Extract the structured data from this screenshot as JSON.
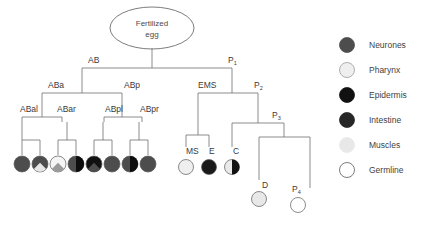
{
  "diagram": {
    "title_node": {
      "line1": "Fertilized",
      "line2": "egg"
    },
    "colors": {
      "neurones": "#4d4d4d",
      "pharynx": "#efefef",
      "epidermis": "#111111",
      "intestine": "#262626",
      "muscles": "#e6e6e6",
      "germline": "#ffffff",
      "line": "#6e6e6e",
      "text": "#3a3a3a",
      "cell_outline": "#5a5a5a"
    },
    "tree_labels": [
      {
        "id": "AB",
        "text": "AB",
        "sub": "",
        "x": 88,
        "y": 63
      },
      {
        "id": "P1",
        "text": "P",
        "sub": "1",
        "x": 228,
        "y": 63
      },
      {
        "id": "ABa",
        "text": "ABa",
        "sub": "",
        "x": 48,
        "y": 88
      },
      {
        "id": "ABp",
        "text": "ABp",
        "sub": "",
        "x": 124,
        "y": 88
      },
      {
        "id": "EMS",
        "text": "EMS",
        "sub": "",
        "x": 198,
        "y": 88
      },
      {
        "id": "P2",
        "text": "P",
        "sub": "2",
        "x": 254,
        "y": 88
      },
      {
        "id": "ABal",
        "text": "ABal",
        "sub": "",
        "x": 20,
        "y": 112
      },
      {
        "id": "ABar",
        "text": "ABar",
        "sub": "",
        "x": 57,
        "y": 112
      },
      {
        "id": "ABpl",
        "text": "ABpl",
        "sub": "",
        "x": 105,
        "y": 112
      },
      {
        "id": "ABpr",
        "text": "ABpr",
        "sub": "",
        "x": 140,
        "y": 112
      },
      {
        "id": "P3",
        "text": "P",
        "sub": "3",
        "x": 272,
        "y": 118
      },
      {
        "id": "MS",
        "text": "MS",
        "sub": "",
        "x": 186,
        "y": 154
      },
      {
        "id": "E",
        "text": "E",
        "sub": "",
        "x": 209,
        "y": 154
      },
      {
        "id": "C",
        "text": "C",
        "sub": "",
        "x": 233,
        "y": 154
      },
      {
        "id": "D",
        "text": "D",
        "sub": "",
        "x": 262,
        "y": 188
      },
      {
        "id": "P4",
        "text": "P",
        "sub": "4",
        "x": 292,
        "y": 192
      }
    ],
    "terminal_cells": [
      {
        "id": "cell-abal-1",
        "x": 22,
        "y": 164,
        "r": 8,
        "fill": "#4d4d4d",
        "wedge": null
      },
      {
        "id": "cell-abal-2",
        "x": 40,
        "y": 164,
        "r": 8,
        "fill": "#4d4d4d",
        "wedge": "#e6e6e6"
      },
      {
        "id": "cell-abar-1",
        "x": 58,
        "y": 164,
        "r": 8,
        "fill": "#f4f4f4",
        "wedge": "#9a9a9a"
      },
      {
        "id": "cell-abar-2",
        "x": 76,
        "y": 164,
        "r": 8,
        "fill": "#4d4d4d",
        "half": "#0d0d0d"
      },
      {
        "id": "cell-abpl-1",
        "x": 94,
        "y": 164,
        "r": 8,
        "fill": "#111111",
        "wedge": "#4d4d4d"
      },
      {
        "id": "cell-abpl-2",
        "x": 112,
        "y": 164,
        "r": 8,
        "fill": "#4d4d4d",
        "wedge": null
      },
      {
        "id": "cell-abpr-1",
        "x": 130,
        "y": 164,
        "r": 8,
        "fill": "#4d4d4d",
        "half": "#0d0d0d"
      },
      {
        "id": "cell-abpr-2",
        "x": 148,
        "y": 164,
        "r": 8,
        "fill": "#4d4d4d",
        "wedge": null
      },
      {
        "id": "cell-ms",
        "x": 186,
        "y": 167,
        "r": 7.5,
        "fill": "#efefef",
        "wedge": null
      },
      {
        "id": "cell-e",
        "x": 209,
        "y": 167,
        "r": 7.5,
        "fill": "#1a1a1a",
        "wedge": null
      },
      {
        "id": "cell-c",
        "x": 232,
        "y": 167,
        "r": 7.5,
        "fill": "#e9e9e9",
        "half": "#111111"
      },
      {
        "id": "cell-d",
        "x": 259,
        "y": 199,
        "r": 7.5,
        "fill": "#e8e8e8",
        "wedge": null
      },
      {
        "id": "cell-p4",
        "x": 298,
        "y": 205,
        "r": 7.5,
        "fill": "#ffffff",
        "wedge": null
      }
    ]
  },
  "legend": {
    "items": [
      {
        "label": "Neurones",
        "color": "#4d4d4d",
        "outline": "#4d4d4d"
      },
      {
        "label": "Pharynx",
        "color": "#efefef",
        "outline": "#9a9a9a"
      },
      {
        "label": "Epidermis",
        "color": "#111111",
        "outline": "#111111"
      },
      {
        "label": "Intestine",
        "color": "#262626",
        "outline": "#262626"
      },
      {
        "label": "Muscles",
        "color": "#e8e8e8",
        "outline": "#e8e8e8"
      },
      {
        "label": "Germline",
        "color": "#ffffff",
        "outline": "#5a5a5a"
      }
    ]
  }
}
